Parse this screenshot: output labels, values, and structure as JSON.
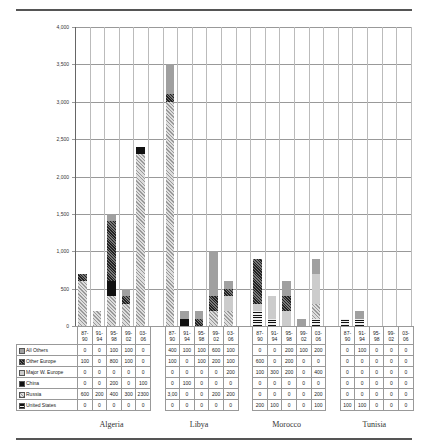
{
  "chart_data": {
    "type": "bar",
    "stacked": true,
    "title": "",
    "xlabel": "",
    "ylabel": "",
    "ylim": [
      0,
      4000
    ],
    "yticks": [
      "0",
      "500",
      "1,000",
      "1,500",
      "2,000",
      "2,500",
      "3,000",
      "3,500",
      "4,000"
    ],
    "grid": true,
    "legend_position": "table-left",
    "groups": [
      "Algeria",
      "Libya",
      "Morocco",
      "Tunisia"
    ],
    "periods": [
      "87-90",
      "91-94",
      "95-98",
      "99-02",
      "03-06"
    ],
    "period_labels": [
      [
        "87-",
        "90"
      ],
      [
        "91-",
        "94"
      ],
      [
        "95-",
        "98"
      ],
      [
        "99-",
        "02"
      ],
      [
        "03-",
        "06"
      ]
    ],
    "series": [
      {
        "name": "All Others",
        "pattern": "p-ao",
        "values": {
          "Algeria": [
            0,
            0,
            100,
            100,
            0
          ],
          "Libya": [
            400,
            100,
            100,
            600,
            100
          ],
          "Morocco": [
            0,
            0,
            200,
            100,
            200
          ],
          "Tunisia": [
            0,
            100,
            0,
            0,
            0
          ]
        }
      },
      {
        "name": "Other Europe",
        "pattern": "p-oe",
        "values": {
          "Algeria": [
            100,
            0,
            800,
            100,
            0
          ],
          "Libya": [
            100,
            0,
            100,
            200,
            100
          ],
          "Morocco": [
            600,
            0,
            200,
            0,
            0
          ],
          "Tunisia": [
            0,
            0,
            0,
            0,
            0
          ]
        }
      },
      {
        "name": "Major W. Europe",
        "pattern": "p-mwe",
        "values": {
          "Algeria": [
            0,
            0,
            0,
            0,
            0
          ],
          "Libya": [
            0,
            0,
            0,
            0,
            200
          ],
          "Morocco": [
            100,
            300,
            200,
            0,
            400
          ],
          "Tunisia": [
            0,
            0,
            0,
            0,
            0
          ]
        }
      },
      {
        "name": "China",
        "pattern": "p-china",
        "values": {
          "Algeria": [
            0,
            0,
            200,
            0,
            100
          ],
          "Libya": [
            0,
            100,
            0,
            0,
            0
          ],
          "Morocco": [
            0,
            0,
            0,
            0,
            0
          ],
          "Tunisia": [
            0,
            0,
            0,
            0,
            0
          ]
        }
      },
      {
        "name": "Russia",
        "pattern": "p-russia",
        "values": {
          "Algeria": [
            600,
            200,
            400,
            300,
            2300
          ],
          "Libya": [
            3000,
            0,
            0,
            200,
            200
          ],
          "Morocco": [
            0,
            0,
            0,
            0,
            200
          ],
          "Tunisia": [
            0,
            0,
            0,
            0,
            0
          ]
        },
        "display_overrides": {
          "Libya": [
            "3,00",
            "0",
            "0",
            "200",
            "200"
          ]
        }
      },
      {
        "name": "United States",
        "pattern": "p-us",
        "values": {
          "Algeria": [
            0,
            0,
            0,
            0,
            0
          ],
          "Libya": [
            0,
            0,
            0,
            0,
            0
          ],
          "Morocco": [
            200,
            100,
            0,
            0,
            100
          ],
          "Tunisia": [
            100,
            100,
            0,
            0,
            0
          ]
        }
      }
    ]
  }
}
